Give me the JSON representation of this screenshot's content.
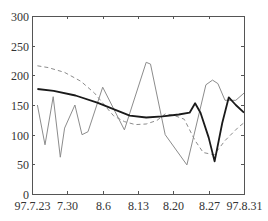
{
  "chart_data": {
    "type": "line",
    "title": "",
    "xlabel": "",
    "ylabel": "",
    "ylim": [
      0,
      300
    ],
    "xlim_days": [
      0,
      39
    ],
    "yticks": [
      0,
      50,
      100,
      150,
      200,
      250,
      300
    ],
    "xticks": [
      {
        "label": "97.7.23",
        "day": 0
      },
      {
        "label": "7.30",
        "day": 6.5
      },
      {
        "label": "8.6",
        "day": 13
      },
      {
        "label": "8.13",
        "day": 19.5
      },
      {
        "label": "8.20",
        "day": 26
      },
      {
        "label": "8.27",
        "day": 32.5
      },
      {
        "label": "97.8.31",
        "day": 39
      }
    ],
    "grid": false,
    "legend": null,
    "series": [
      {
        "name": "thin-gray-series",
        "style": "thin-solid",
        "color": "#8c8c8c",
        "points": [
          [
            1,
            150
          ],
          [
            2.4,
            83
          ],
          [
            3.9,
            164
          ],
          [
            5.2,
            62
          ],
          [
            6,
            111
          ],
          [
            7.9,
            150
          ],
          [
            9.2,
            100
          ],
          [
            10.3,
            105
          ],
          [
            13,
            180
          ],
          [
            17,
            108
          ],
          [
            21,
            222
          ],
          [
            21.8,
            219
          ],
          [
            24.5,
            100
          ],
          [
            28.5,
            49
          ],
          [
            32,
            184
          ],
          [
            33.2,
            192
          ],
          [
            34.2,
            186
          ],
          [
            35.5,
            158
          ],
          [
            37.5,
            158
          ],
          [
            39,
            170
          ]
        ]
      },
      {
        "name": "dashed-series",
        "style": "dashed",
        "color": "#8c8c8c",
        "points": [
          [
            1,
            216
          ],
          [
            3,
            213
          ],
          [
            6,
            205
          ],
          [
            9,
            190
          ],
          [
            11.5,
            170
          ],
          [
            13.5,
            148
          ],
          [
            15,
            132
          ],
          [
            17,
            122
          ],
          [
            19,
            117
          ],
          [
            21,
            118
          ],
          [
            23,
            124
          ],
          [
            24.5,
            135
          ],
          [
            26,
            133
          ],
          [
            28,
            126
          ],
          [
            30,
            90
          ],
          [
            31.5,
            70
          ],
          [
            33.5,
            66
          ],
          [
            35.5,
            90
          ],
          [
            38,
            113
          ],
          [
            39,
            120
          ]
        ]
      },
      {
        "name": "thick-black-series",
        "style": "thick-solid",
        "color": "#1a1a1a",
        "points": [
          [
            1,
            177
          ],
          [
            4,
            174
          ],
          [
            8,
            166
          ],
          [
            12,
            154
          ],
          [
            15,
            143
          ],
          [
            18,
            132
          ],
          [
            21,
            129
          ],
          [
            24,
            131
          ],
          [
            27,
            134
          ],
          [
            29,
            137
          ],
          [
            30,
            153
          ],
          [
            31,
            137
          ],
          [
            32.5,
            95
          ],
          [
            33.6,
            55
          ],
          [
            35,
            120
          ],
          [
            36.2,
            163
          ],
          [
            37.5,
            150
          ],
          [
            39,
            137
          ]
        ]
      }
    ]
  },
  "layout": {
    "plot_left": 32,
    "plot_right": 244,
    "plot_top": 16,
    "plot_bottom": 194
  }
}
